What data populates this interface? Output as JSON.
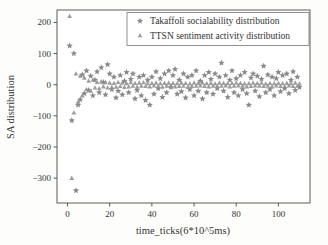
{
  "figure": {
    "background_color": "#fdfdfc",
    "frame_color": "#4a4a4a",
    "text_color": "#333333"
  },
  "chart_data": {
    "type": "scatter",
    "title": "",
    "xlabel": "time_ticks(6*10^5ms)",
    "ylabel": "SA distribution",
    "xlim": [
      -5,
      115
    ],
    "ylim": [
      -380,
      240
    ],
    "x_ticks": [
      0,
      20,
      40,
      60,
      80,
      100
    ],
    "y_ticks": [
      200,
      100,
      0,
      -100,
      -200,
      -300
    ],
    "grid": false,
    "legend_position": "upper right",
    "series": [
      {
        "name": "Takaffoli socialability distribution",
        "marker": "star",
        "color": "#7d7d7d",
        "points": [
          [
            1,
            125
          ],
          [
            2,
            -115
          ],
          [
            3,
            100
          ],
          [
            4,
            -340
          ],
          [
            5,
            -65
          ],
          [
            6,
            -48
          ],
          [
            7,
            32
          ],
          [
            8,
            -28
          ],
          [
            9,
            45
          ],
          [
            10,
            -18
          ],
          [
            11,
            28
          ],
          [
            12,
            -35
          ],
          [
            13,
            15
          ],
          [
            14,
            42
          ],
          [
            15,
            -25
          ],
          [
            16,
            55
          ],
          [
            17,
            8
          ],
          [
            18,
            -32
          ],
          [
            19,
            65
          ],
          [
            20,
            35
          ],
          [
            21,
            -15
          ],
          [
            22,
            25
          ],
          [
            23,
            -42
          ],
          [
            24,
            -20
          ],
          [
            25,
            30
          ],
          [
            26,
            -32
          ],
          [
            27,
            12
          ],
          [
            28,
            40
          ],
          [
            29,
            -25
          ],
          [
            30,
            18
          ],
          [
            31,
            35
          ],
          [
            32,
            -45
          ],
          [
            33,
            -18
          ],
          [
            34,
            25
          ],
          [
            35,
            -35
          ],
          [
            36,
            30
          ],
          [
            37,
            -50
          ],
          [
            38,
            15
          ],
          [
            39,
            -65
          ],
          [
            40,
            25
          ],
          [
            41,
            -30
          ],
          [
            42,
            42
          ],
          [
            43,
            -12
          ],
          [
            44,
            20
          ],
          [
            45,
            -40
          ],
          [
            46,
            35
          ],
          [
            47,
            -25
          ],
          [
            48,
            45
          ],
          [
            49,
            -8
          ],
          [
            50,
            30
          ],
          [
            51,
            50
          ],
          [
            52,
            -30
          ],
          [
            53,
            15
          ],
          [
            54,
            -22
          ],
          [
            55,
            35
          ],
          [
            56,
            -42
          ],
          [
            57,
            25
          ],
          [
            58,
            -15
          ],
          [
            59,
            30
          ],
          [
            60,
            -35
          ],
          [
            61,
            45
          ],
          [
            62,
            -20
          ],
          [
            63,
            12
          ],
          [
            64,
            -45
          ],
          [
            65,
            30
          ],
          [
            66,
            -25
          ],
          [
            67,
            40
          ],
          [
            68,
            18
          ],
          [
            69,
            -30
          ],
          [
            70,
            35
          ],
          [
            71,
            -12
          ],
          [
            72,
            25
          ],
          [
            73,
            70
          ],
          [
            74,
            -20
          ],
          [
            75,
            30
          ],
          [
            76,
            -40
          ],
          [
            77,
            15
          ],
          [
            78,
            45
          ],
          [
            79,
            -25
          ],
          [
            80,
            20
          ],
          [
            81,
            -35
          ],
          [
            82,
            30
          ],
          [
            83,
            -15
          ],
          [
            84,
            40
          ],
          [
            85,
            -28
          ],
          [
            86,
            -65
          ],
          [
            87,
            22
          ],
          [
            88,
            35
          ],
          [
            89,
            -20
          ],
          [
            90,
            28
          ],
          [
            91,
            -38
          ],
          [
            92,
            18
          ],
          [
            93,
            60
          ],
          [
            94,
            -25
          ],
          [
            95,
            32
          ],
          [
            96,
            -15
          ],
          [
            97,
            25
          ],
          [
            98,
            -35
          ],
          [
            99,
            20
          ],
          [
            100,
            40
          ],
          [
            101,
            -22
          ],
          [
            102,
            30
          ],
          [
            103,
            -12
          ],
          [
            104,
            35
          ],
          [
            105,
            -28
          ],
          [
            106,
            15
          ],
          [
            107,
            42
          ],
          [
            108,
            -18
          ],
          [
            109,
            25
          ],
          [
            110,
            -8
          ]
        ]
      },
      {
        "name": "TTSN sentiment activity distribution",
        "marker": "triangle",
        "color": "#929292",
        "points": [
          [
            1,
            220
          ],
          [
            2,
            -300
          ],
          [
            3,
            -90
          ],
          [
            4,
            35
          ],
          [
            5,
            -55
          ],
          [
            6,
            28
          ],
          [
            7,
            -35
          ],
          [
            8,
            22
          ],
          [
            9,
            -15
          ],
          [
            10,
            12
          ],
          [
            11,
            -20
          ],
          [
            12,
            15
          ],
          [
            13,
            -10
          ],
          [
            14,
            8
          ],
          [
            15,
            -12
          ],
          [
            16,
            10
          ],
          [
            17,
            -6
          ],
          [
            18,
            8
          ],
          [
            19,
            -10
          ],
          [
            20,
            6
          ],
          [
            21,
            -8
          ],
          [
            22,
            5
          ],
          [
            23,
            -7
          ],
          [
            24,
            8
          ],
          [
            25,
            -5
          ],
          [
            26,
            6
          ],
          [
            27,
            -8
          ],
          [
            28,
            4
          ],
          [
            29,
            -6
          ],
          [
            30,
            7
          ],
          [
            31,
            -4
          ],
          [
            32,
            5
          ],
          [
            33,
            -7
          ],
          [
            34,
            6
          ],
          [
            35,
            -4
          ],
          [
            36,
            7
          ],
          [
            37,
            -5
          ],
          [
            38,
            4
          ],
          [
            39,
            -6
          ],
          [
            40,
            5
          ],
          [
            41,
            -3
          ],
          [
            42,
            6
          ],
          [
            43,
            -5
          ],
          [
            44,
            4
          ],
          [
            45,
            -7
          ],
          [
            46,
            5
          ],
          [
            47,
            -4
          ],
          [
            48,
            6
          ],
          [
            49,
            -3
          ],
          [
            50,
            5
          ],
          [
            51,
            -6
          ],
          [
            52,
            4
          ],
          [
            53,
            -5
          ],
          [
            54,
            6
          ],
          [
            55,
            -4
          ],
          [
            56,
            5
          ],
          [
            57,
            -7
          ],
          [
            58,
            3
          ],
          [
            59,
            -5
          ],
          [
            60,
            6
          ],
          [
            61,
            -4
          ],
          [
            62,
            5
          ],
          [
            63,
            -3
          ],
          [
            64,
            6
          ],
          [
            65,
            -5
          ],
          [
            66,
            4
          ],
          [
            67,
            -6
          ],
          [
            68,
            5
          ],
          [
            69,
            -4
          ],
          [
            70,
            3
          ],
          [
            71,
            -5
          ],
          [
            72,
            6
          ],
          [
            73,
            -4
          ],
          [
            74,
            5
          ],
          [
            75,
            -3
          ],
          [
            76,
            4
          ],
          [
            77,
            -6
          ],
          [
            78,
            5
          ],
          [
            79,
            -4
          ],
          [
            80,
            6
          ],
          [
            81,
            -3
          ],
          [
            82,
            5
          ],
          [
            83,
            -4
          ],
          [
            84,
            3
          ],
          [
            85,
            -6
          ],
          [
            86,
            4
          ],
          [
            87,
            -5
          ],
          [
            88,
            6
          ],
          [
            89,
            -3
          ],
          [
            90,
            5
          ],
          [
            91,
            -4
          ],
          [
            92,
            6
          ],
          [
            93,
            -5
          ],
          [
            94,
            3
          ],
          [
            95,
            -4
          ],
          [
            96,
            5
          ],
          [
            97,
            -6
          ],
          [
            98,
            4
          ],
          [
            99,
            -3
          ],
          [
            100,
            5
          ],
          [
            101,
            -5
          ],
          [
            102,
            4
          ],
          [
            103,
            -6
          ],
          [
            104,
            5
          ],
          [
            105,
            -3
          ],
          [
            106,
            4
          ],
          [
            107,
            -5
          ],
          [
            108,
            6
          ],
          [
            109,
            -4
          ],
          [
            110,
            3
          ]
        ]
      }
    ]
  }
}
